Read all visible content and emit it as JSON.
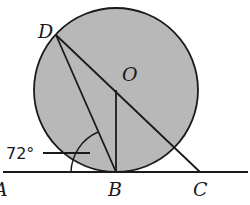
{
  "diagram": {
    "type": "geometry",
    "circle": {
      "center_label": "O",
      "fill": "#b8b8b8",
      "stroke": "#1a1a1a"
    },
    "points": {
      "A": {
        "label": "A"
      },
      "B": {
        "label": "B"
      },
      "C": {
        "label": "C"
      },
      "D": {
        "label": "D"
      },
      "O": {
        "label": "O"
      }
    },
    "angle_annotation": "72°",
    "segments": [
      "DB",
      "DC",
      "OB",
      "AC (tangent line)"
    ]
  }
}
